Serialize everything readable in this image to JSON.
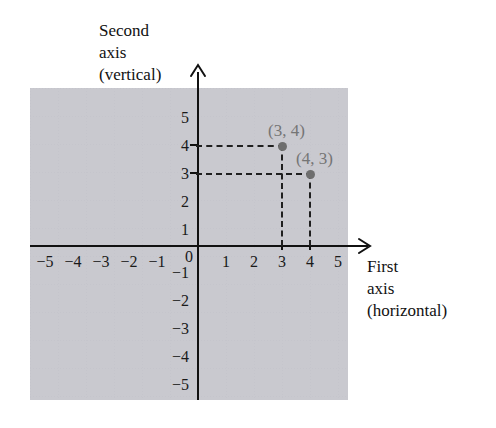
{
  "figure": {
    "axis_titles": {
      "vertical": [
        "Second",
        "axis",
        "(vertical)"
      ],
      "horizontal": [
        "First",
        "axis",
        "(horizontal)"
      ]
    },
    "origin_label": "0",
    "x_tick_labels": [
      "−5",
      "−4",
      "−3",
      "−2",
      "−1",
      "1",
      "2",
      "3",
      "4",
      "5"
    ],
    "y_tick_labels": [
      "5",
      "4",
      "3",
      "2",
      "1",
      "−1",
      "−2",
      "−3",
      "−4",
      "−5"
    ],
    "point_labels": [
      "(3, 4)",
      "(4, 3)"
    ],
    "colors": {
      "axis": "#111111",
      "grid": "#c5c5cc",
      "point": "#6e6e6e",
      "point_label": "#757575",
      "dash": "#1f1f1f",
      "background": "#ffffff"
    }
  },
  "chart_data": {
    "type": "scatter",
    "title": "",
    "xlabel": "First axis (horizontal)",
    "ylabel": "Second axis (vertical)",
    "xlim": [
      -6,
      6
    ],
    "ylim": [
      -6,
      6
    ],
    "xticks": [
      -5,
      -4,
      -3,
      -2,
      -1,
      0,
      1,
      2,
      3,
      4,
      5
    ],
    "yticks": [
      -5,
      -4,
      -3,
      -2,
      -1,
      0,
      1,
      2,
      3,
      4,
      5
    ],
    "grid": true,
    "legend": "none",
    "points": [
      {
        "label": "(3, 4)",
        "x": 3,
        "y": 4
      },
      {
        "label": "(4, 3)",
        "x": 4,
        "y": 3
      }
    ],
    "annotations": [
      "dashed guide from (0,4) to (3,4)",
      "dashed guide from (3,4) to (3,0)",
      "dashed guide from (0,3) to (4,3)",
      "dashed guide from (4,3) to (4,0)"
    ]
  }
}
